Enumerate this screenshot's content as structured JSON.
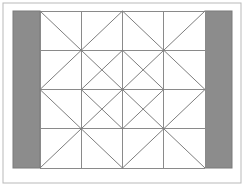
{
  "figure": {
    "title": "Geometric quilt block pattern",
    "canvas": {
      "width": 244,
      "height": 186,
      "background": "#ffffff"
    },
    "frame": {
      "name": "outer-frame",
      "x": 3,
      "y": 3,
      "width": 238,
      "height": 180,
      "stroke": "#b9b9b9",
      "stroke_width": 1,
      "fill": "none"
    },
    "plot_area": {
      "name": "pattern-area",
      "x0": 40,
      "y0": 11,
      "x1": 205,
      "y1": 168,
      "columns": 4,
      "rows": 4,
      "cell_width": 41.25,
      "cell_height": 39.25,
      "fill": "#ffffff"
    },
    "bands": [
      {
        "name": "left-gray-band",
        "x": 13,
        "y": 11,
        "width": 27,
        "height": 157,
        "fill": "#8c8c8c",
        "stroke": "#7a7a7a",
        "stroke_width": 1
      },
      {
        "name": "right-gray-band",
        "x": 205,
        "y": 11,
        "width": 27,
        "height": 157,
        "fill": "#8c8c8c",
        "stroke": "#7a7a7a",
        "stroke_width": 1
      }
    ],
    "grid": {
      "name": "tile-grid",
      "stroke": "#8a8a8a",
      "stroke_width": 1,
      "x_positions": [
        40,
        81.25,
        122.5,
        163.75,
        205
      ],
      "y_positions": [
        11,
        50.25,
        89.5,
        128.75,
        168
      ]
    },
    "diagonals": {
      "name": "diagonal-lines",
      "stroke": "#7e7e7e",
      "stroke_width": 1,
      "note": "One diagonal per tile; orientation mirrors across both the vertical and horizontal center lines, producing concentric diamonds.",
      "cells": [
        {
          "row": 0,
          "col": 0,
          "orientation": "backslash"
        },
        {
          "row": 0,
          "col": 1,
          "orientation": "slash"
        },
        {
          "row": 0,
          "col": 2,
          "orientation": "backslash"
        },
        {
          "row": 0,
          "col": 3,
          "orientation": "slash"
        },
        {
          "row": 1,
          "col": 0,
          "orientation": "slash"
        },
        {
          "row": 1,
          "col": 1,
          "orientation": "backslash"
        },
        {
          "row": 1,
          "col": 2,
          "orientation": "slash"
        },
        {
          "row": 1,
          "col": 3,
          "orientation": "backslash"
        },
        {
          "row": 2,
          "col": 0,
          "orientation": "backslash"
        },
        {
          "row": 2,
          "col": 1,
          "orientation": "slash"
        },
        {
          "row": 2,
          "col": 2,
          "orientation": "backslash"
        },
        {
          "row": 2,
          "col": 3,
          "orientation": "slash"
        },
        {
          "row": 3,
          "col": 0,
          "orientation": "slash"
        },
        {
          "row": 3,
          "col": 1,
          "orientation": "backslash"
        },
        {
          "row": 3,
          "col": 2,
          "orientation": "slash"
        },
        {
          "row": 3,
          "col": 3,
          "orientation": "backslash"
        }
      ]
    },
    "extra_diagonals": {
      "name": "inner-diamond-lines",
      "stroke": "#7e7e7e",
      "stroke_width": 1,
      "note": "Second diagonal drawn in the four central tiles to close the inner diamond.",
      "cells": [
        {
          "row": 1,
          "col": 1,
          "orientation": "slash"
        },
        {
          "row": 1,
          "col": 2,
          "orientation": "backslash"
        },
        {
          "row": 2,
          "col": 1,
          "orientation": "backslash"
        },
        {
          "row": 2,
          "col": 2,
          "orientation": "slash"
        }
      ]
    }
  }
}
